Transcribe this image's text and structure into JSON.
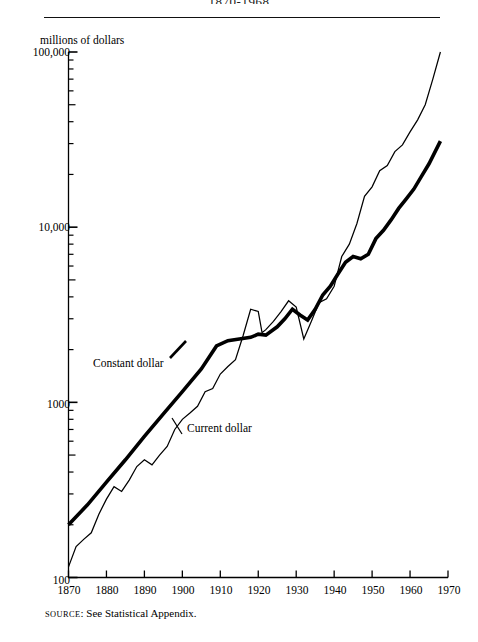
{
  "figure": {
    "title": "1870-1968",
    "y_axis_title": "millions of dollars",
    "source_prefix": "SOURCE",
    "source_separator": ": ",
    "source_text": "See Statistical Appendix."
  },
  "labels": {
    "constant": "Constant dollar",
    "current": "Current dollar"
  },
  "colors": {
    "ink": "#000000",
    "background": "#ffffff",
    "rule": "#111111"
  },
  "chart_data": {
    "type": "line",
    "title": "1870-1968",
    "xlabel": "",
    "ylabel": "millions of dollars",
    "yscale": "log",
    "ylim": [
      100,
      100000
    ],
    "xlim": [
      1870,
      1970
    ],
    "grid": false,
    "legend_position": "inline-annotation",
    "ytick_labels": [
      "100,000",
      "10,000",
      "1000",
      "100"
    ],
    "ytick_values": [
      100000,
      10000,
      1000,
      100
    ],
    "minor_ticks": true,
    "xtick_labels": [
      "1870",
      "1880",
      "1890",
      "1900",
      "1910",
      "1920",
      "1930",
      "1940",
      "1950",
      "1960",
      "1970"
    ],
    "xtick_values": [
      1870,
      1880,
      1890,
      1900,
      1910,
      1920,
      1930,
      1940,
      1950,
      1960,
      1970
    ],
    "series": [
      {
        "name": "Constant dollar",
        "style": "thick",
        "x": [
          1870,
          1875,
          1880,
          1885,
          1890,
          1895,
          1900,
          1905,
          1909,
          1912,
          1915,
          1918,
          1920,
          1922,
          1925,
          1927,
          1929,
          1931,
          1933,
          1935,
          1937,
          1939,
          1941,
          1943,
          1945,
          1947,
          1949,
          1951,
          1953,
          1955,
          1957,
          1959,
          1961,
          1963,
          1965,
          1968
        ],
        "y": [
          200,
          260,
          350,
          470,
          640,
          860,
          1150,
          1550,
          2100,
          2250,
          2300,
          2350,
          2450,
          2420,
          2700,
          3000,
          3400,
          3150,
          2950,
          3400,
          4100,
          4600,
          5400,
          6300,
          6800,
          6600,
          7000,
          8600,
          9600,
          11000,
          12800,
          14500,
          16500,
          19500,
          23000,
          31000
        ]
      },
      {
        "name": "Current dollar",
        "style": "thin",
        "x": [
          1870,
          1872,
          1874,
          1876,
          1878,
          1880,
          1882,
          1884,
          1886,
          1888,
          1890,
          1892,
          1894,
          1896,
          1898,
          1900,
          1902,
          1904,
          1906,
          1908,
          1910,
          1912,
          1914,
          1916,
          1918,
          1920,
          1921,
          1922,
          1924,
          1926,
          1928,
          1930,
          1932,
          1934,
          1936,
          1938,
          1940,
          1942,
          1944,
          1946,
          1948,
          1950,
          1952,
          1954,
          1956,
          1958,
          1960,
          1962,
          1964,
          1966,
          1968
        ],
        "y": [
          115,
          150,
          165,
          180,
          230,
          280,
          330,
          310,
          360,
          430,
          470,
          440,
          500,
          560,
          700,
          800,
          870,
          950,
          1150,
          1200,
          1450,
          1600,
          1750,
          2400,
          3400,
          3300,
          2500,
          2600,
          2900,
          3300,
          3800,
          3500,
          2300,
          2900,
          3700,
          3900,
          4600,
          6800,
          8000,
          10500,
          15000,
          17000,
          21000,
          22500,
          27000,
          29500,
          35000,
          41000,
          50000,
          70000,
          100000
        ]
      }
    ]
  }
}
